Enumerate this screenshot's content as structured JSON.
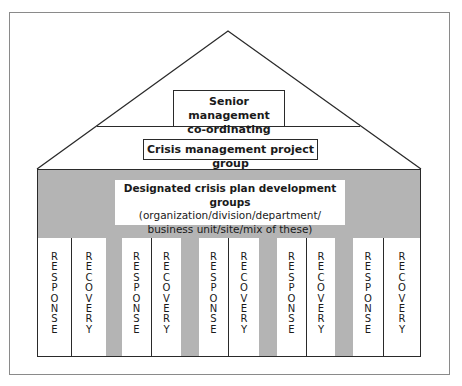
{
  "diagram": {
    "type": "house-structure",
    "colors": {
      "line": "#2a2a2a",
      "body_fill": "#b4b4b4",
      "box_fill": "#ffffff",
      "frame": "#8a8a8a"
    },
    "roof": {
      "top_tier": {
        "label_line1": "Senior management",
        "label_line2": "co-ordinating group"
      },
      "middle_tier": {
        "label": "Crisis management project group"
      }
    },
    "body": {
      "title": "Designated crisis plan development groups",
      "subtitle_line1": "(organization/division/department/",
      "subtitle_line2": "business unit/site/mix of these)"
    },
    "pillars": [
      {
        "left": "RESPONSE",
        "right": "RECOVERY"
      },
      {
        "left": "RESPONSE",
        "right": "RECOVERY"
      },
      {
        "left": "RESPONSE",
        "right": "RECOVERY"
      },
      {
        "left": "RESPONSE",
        "right": "RECOVERY"
      },
      {
        "left": "RESPONSE",
        "right": "RECOVERY"
      }
    ]
  }
}
